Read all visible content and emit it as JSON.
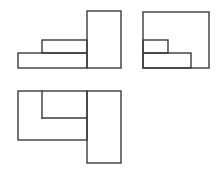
{
  "diagram": {
    "type": "orthographic-three-view",
    "stroke_color": "#3a3a3a",
    "background": "#ffffff",
    "views": [
      {
        "name": "front-view",
        "rects": [
          {
            "x": 18,
            "y": 53,
            "w": 69,
            "h": 15
          },
          {
            "x": 42,
            "y": 40,
            "w": 45,
            "h": 13
          },
          {
            "x": 87,
            "y": 11,
            "w": 34,
            "h": 57
          }
        ],
        "lines": []
      },
      {
        "name": "side-view",
        "rects": [
          {
            "x": 143,
            "y": 12,
            "w": 66,
            "h": 56
          },
          {
            "x": 143,
            "y": 40,
            "w": 25,
            "h": 13
          },
          {
            "x": 143,
            "y": 53,
            "w": 48,
            "h": 15
          }
        ],
        "lines": []
      },
      {
        "name": "top-view",
        "rects": [
          {
            "x": 18,
            "y": 91,
            "w": 69,
            "h": 49
          },
          {
            "x": 87,
            "y": 91,
            "w": 34,
            "h": 72
          }
        ],
        "lines": [
          {
            "x1": 42,
            "y1": 91,
            "x2": 42,
            "y2": 118
          },
          {
            "x1": 42,
            "y1": 118,
            "x2": 87,
            "y2": 118
          }
        ]
      }
    ]
  }
}
